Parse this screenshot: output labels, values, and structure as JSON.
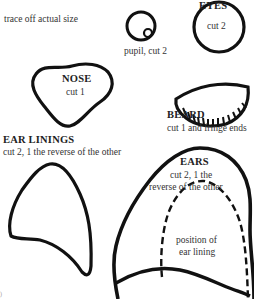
{
  "instructions": {
    "text": "trace off actual size"
  },
  "eyes": {
    "title": "EYES",
    "eye_cut": "cut 2",
    "pupil_label": "pupil, cut 2"
  },
  "nose": {
    "title": "NOSE",
    "cut": "cut 1"
  },
  "beard": {
    "title": "BEARD",
    "cut": "cut 1 and fringe ends"
  },
  "ear_linings": {
    "title": "EAR LININGS",
    "cut": "cut 2, 1 the reverse of the other"
  },
  "ears": {
    "title": "EARS",
    "cut_line1": "cut 2, 1 the",
    "cut_line2": "reverse of the other",
    "lining_line1": "position of",
    "lining_line2": "ear lining"
  },
  "colors": {
    "outline": "#111111",
    "text": "#2a2a2a",
    "background": "#ffffff"
  }
}
